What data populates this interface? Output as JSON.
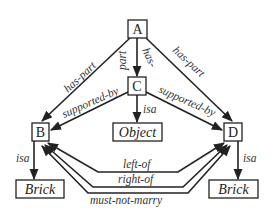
{
  "diagram": {
    "nodes": {
      "A": {
        "label": "A"
      },
      "B": {
        "label": "B"
      },
      "C": {
        "label": "C"
      },
      "D": {
        "label": "D"
      },
      "object": {
        "label": "Object"
      },
      "brick_left": {
        "label": "Brick"
      },
      "brick_right": {
        "label": "Brick"
      }
    },
    "edges": {
      "a_b": {
        "label": "has-part"
      },
      "a_c_1": {
        "label": "part"
      },
      "a_c_2": {
        "label": "has-"
      },
      "a_d": {
        "label": "has-part"
      },
      "c_b": {
        "label": "supported-by"
      },
      "c_d": {
        "label": "supported-by"
      },
      "c_object": {
        "label": "isa"
      },
      "b_brick": {
        "label": "isa"
      },
      "d_brick": {
        "label": "isa"
      },
      "b_d_left": {
        "label": "left-of"
      },
      "d_b_right": {
        "label": "right-of"
      },
      "b_d_marry": {
        "label": "must-not-marry"
      }
    }
  }
}
